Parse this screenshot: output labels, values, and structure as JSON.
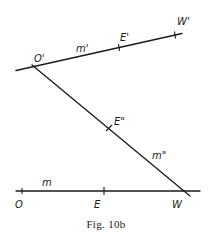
{
  "figure": {
    "caption": "Fig. 10b",
    "lines": {
      "m_prime": {
        "label": "m'",
        "points": {
          "O_prime": "O'",
          "E_prime": "E'",
          "W_prime": "W'"
        }
      },
      "m_double_prime": {
        "label": "m\"",
        "points": {
          "E_double_prime": "E\""
        }
      },
      "m": {
        "label": "m",
        "points": {
          "O": "O",
          "E": "E",
          "W": "W"
        }
      }
    }
  },
  "colors": {
    "ink": "#1a1a1a",
    "background": "#ffffff"
  }
}
